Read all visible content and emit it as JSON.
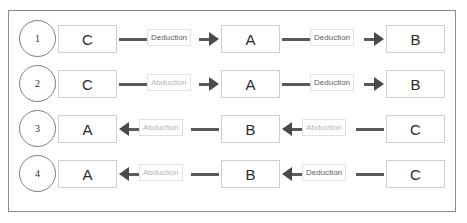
{
  "figure": {
    "rows": [
      {
        "index": "1",
        "terms": [
          "C",
          "A",
          "B"
        ],
        "links": [
          {
            "label": "Deduction",
            "kind": "deduction",
            "direction": "right"
          },
          {
            "label": "Deduction",
            "kind": "deduction",
            "direction": "right"
          }
        ]
      },
      {
        "index": "2",
        "terms": [
          "C",
          "A",
          "B"
        ],
        "links": [
          {
            "label": "Abduction",
            "kind": "abduction",
            "direction": "right"
          },
          {
            "label": "Deduction",
            "kind": "deduction",
            "direction": "right"
          }
        ]
      },
      {
        "index": "3",
        "terms": [
          "A",
          "B",
          "C"
        ],
        "links": [
          {
            "label": "Abduction",
            "kind": "abduction",
            "direction": "left"
          },
          {
            "label": "Abduction",
            "kind": "abduction",
            "direction": "left"
          }
        ]
      },
      {
        "index": "4",
        "terms": [
          "A",
          "B",
          "C"
        ],
        "links": [
          {
            "label": "Abduction",
            "kind": "abduction",
            "direction": "left"
          },
          {
            "label": "Deduction",
            "kind": "deduction",
            "direction": "left"
          }
        ]
      }
    ],
    "colors": {
      "frame_border": "#8d8d8d",
      "term_border": "#cfcfcf",
      "connector_line": "#5a5a5a",
      "arrow_fill": "#4a4a4a",
      "label_border": "#e0e0e0",
      "deduction_text": "#5d5d5d",
      "abduction_text": "#b4b4b4",
      "index_text": "#2a2a2a",
      "term_text": "#2b2b2b",
      "background": "#ffffff"
    }
  }
}
